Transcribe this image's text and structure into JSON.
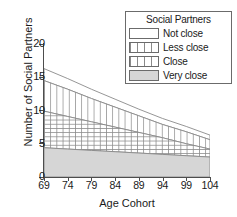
{
  "chart_data": {
    "type": "area",
    "stacked": true,
    "title": "",
    "xlabel": "Age Cohort",
    "ylabel": "Number of Social Partners",
    "x": [
      69,
      74,
      79,
      84,
      89,
      94,
      99,
      104
    ],
    "xlim": [
      69,
      104
    ],
    "ylim": [
      0,
      20
    ],
    "yticks": [
      0,
      5,
      10,
      15,
      20
    ],
    "xticks": [
      69,
      74,
      79,
      84,
      89,
      94,
      99,
      104
    ],
    "grid": false,
    "legend_title": "Social Partners",
    "legend_position": "top-right",
    "series": [
      {
        "name": "Very close",
        "pattern": "solid-gray",
        "color": "#d6d6d6",
        "values": [
          4.4,
          4.2,
          4.0,
          3.8,
          3.6,
          3.4,
          3.2,
          3.0
        ],
        "cumulative_top": [
          4.4,
          4.2,
          4.0,
          3.8,
          3.6,
          3.4,
          3.2,
          3.0
        ]
      },
      {
        "name": "Close",
        "pattern": "cross-hatch",
        "color": "#ffffff",
        "values": [
          5.5,
          4.9,
          4.3,
          3.7,
          3.1,
          2.5,
          1.8,
          1.2
        ],
        "cumulative_top": [
          9.9,
          9.1,
          8.3,
          7.5,
          6.7,
          5.9,
          5.0,
          4.2
        ]
      },
      {
        "name": "Less close",
        "pattern": "vertical-lines",
        "color": "#ffffff",
        "values": [
          4.6,
          4.1,
          3.5,
          3.0,
          2.5,
          2.0,
          1.8,
          1.4
        ],
        "cumulative_top": [
          14.5,
          13.2,
          11.8,
          10.5,
          9.2,
          7.9,
          6.8,
          5.6
        ]
      },
      {
        "name": "Not close",
        "pattern": "none",
        "color": "#ffffff",
        "values": [
          1.8,
          1.6,
          1.4,
          1.2,
          1.0,
          0.9,
          0.8,
          0.7
        ],
        "cumulative_top": [
          16.3,
          14.8,
          13.2,
          11.7,
          10.2,
          8.8,
          7.6,
          6.3
        ]
      }
    ]
  },
  "axes": {
    "y_title": "Number of Social Partners",
    "x_title": "Age Cohort",
    "y_ticks": [
      "0",
      "5",
      "10",
      "15",
      "20"
    ],
    "x_ticks": [
      "69",
      "74",
      "79",
      "84",
      "89",
      "94",
      "99",
      "104"
    ]
  },
  "legend": {
    "title": "Social Partners",
    "items": [
      {
        "label": "Not close",
        "swatch": "empty-swatch"
      },
      {
        "label": "Less close",
        "swatch": "vertical-lines-swatch"
      },
      {
        "label": "Close",
        "swatch": "cross-hatch-swatch"
      },
      {
        "label": "Very close",
        "swatch": "solid-gray-swatch"
      }
    ]
  },
  "colors": {
    "very_close_fill": "#d6d6d6",
    "line": "#8a8a8a",
    "axis": "#4d4d4d"
  }
}
